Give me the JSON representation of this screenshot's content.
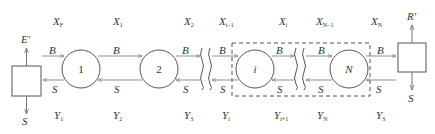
{
  "diagram": {
    "type": "multi-stage countercurrent cascade",
    "left_unit": {
      "top_label": "E′",
      "bottom_label": "S"
    },
    "right_unit": {
      "top_label": "R′",
      "bottom_label": "S"
    },
    "stages": [
      {
        "label": "1"
      },
      {
        "label": "2"
      },
      {
        "label": "i"
      },
      {
        "label": "N"
      }
    ],
    "stream_labels": {
      "forward": "B",
      "backward": "S"
    },
    "top_labels": [
      {
        "base": "X",
        "sub": "F"
      },
      {
        "base": "X",
        "sub": "1"
      },
      {
        "base": "X",
        "sub": "2"
      },
      {
        "base": "X",
        "sub": "i−1"
      },
      {
        "base": "X",
        "sub": "i"
      },
      {
        "base": "X",
        "sub": "N−1"
      },
      {
        "base": "X",
        "sub": "N"
      }
    ],
    "bottom_labels": [
      {
        "base": "Y",
        "sub": "1"
      },
      {
        "base": "Y",
        "sub": "2"
      },
      {
        "base": "Y",
        "sub": "3"
      },
      {
        "base": "Y",
        "sub": "i"
      },
      {
        "base": "Y",
        "sub": "i+1"
      },
      {
        "base": "Y",
        "sub": "N"
      },
      {
        "base": "Y",
        "sub": "S"
      }
    ],
    "colors": {
      "line": "#555555",
      "text": "#333333"
    }
  }
}
